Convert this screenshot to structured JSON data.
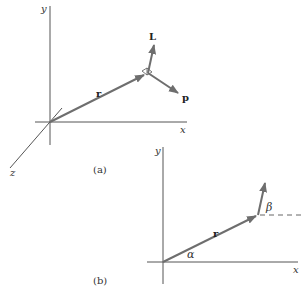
{
  "figure_a": {
    "caption": "(a)",
    "axes": {
      "x": "x",
      "y": "y",
      "z": "z"
    },
    "vectors": {
      "position": "r",
      "angular_momentum": "L",
      "momentum": "p"
    }
  },
  "figure_b": {
    "caption": "(b)",
    "axes": {
      "x": "x",
      "y": "y"
    },
    "vectors": {
      "position": "r"
    },
    "angles": {
      "alpha": "α",
      "beta": "β"
    }
  },
  "colors": {
    "vector": "#6e6e6e",
    "axis": "#555555",
    "text": "#333333"
  }
}
